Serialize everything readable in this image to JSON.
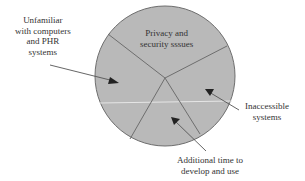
{
  "diagram": {
    "type": "pie-style segmented circle with callout labels",
    "colors": {
      "fill": "#b9b9b9",
      "stroke": "#6e6e6e",
      "text": "#333333",
      "highlight": "#e6e6e6"
    },
    "segments": [
      {
        "id": "privacy",
        "label_lines": [
          "Privacy and",
          "security sssues"
        ]
      },
      {
        "id": "inaccessible",
        "label_lines": [
          "Inaccessible",
          "systems"
        ]
      },
      {
        "id": "additional-time",
        "label_lines": [
          "Additional time to",
          "develop and use"
        ]
      },
      {
        "id": "unfamiliar",
        "label_lines": [
          "Unfamiliar",
          "with computers",
          "and PHR",
          "systems"
        ]
      }
    ]
  }
}
